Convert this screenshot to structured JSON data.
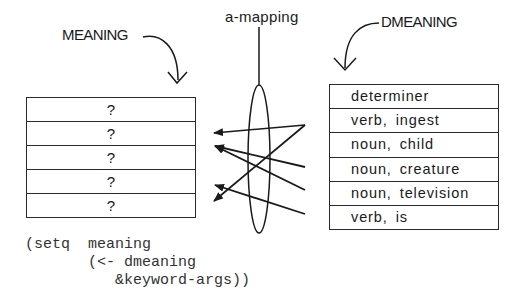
{
  "labels": {
    "meaning": "MEANING",
    "dmeaning": "DMEANING",
    "a_mapping": "a-mapping"
  },
  "meaning_table": {
    "rows": [
      "?",
      "?",
      "?",
      "?",
      "?"
    ]
  },
  "dmeaning_table": {
    "rows": [
      "determiner",
      "verb, ingest",
      "noun, child",
      "noun, creature",
      "noun, television",
      "verb, is"
    ]
  },
  "code": {
    "lines": [
      "(setq  meaning",
      "       (<- dmeaning",
      "          &keyword-args))"
    ]
  },
  "mappings": [
    {
      "from": "determiner",
      "to_row": 1
    },
    {
      "from": "determiner",
      "to_row": 4
    },
    {
      "from": "noun, child",
      "to_row": 2
    },
    {
      "from": "noun, creature",
      "to_row": 2
    },
    {
      "from": "noun, television",
      "to_row": 4
    }
  ],
  "colors": {
    "ink": "#1a1a1a",
    "code": "#333333",
    "background": "#ffffff"
  }
}
